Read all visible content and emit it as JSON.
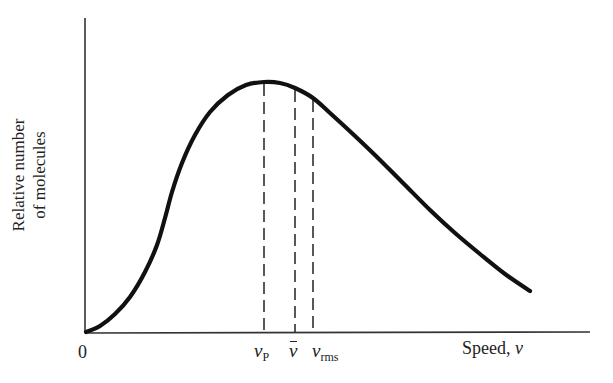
{
  "chart_data": {
    "type": "line",
    "title": "",
    "xlabel": "Speed, v",
    "ylabel": "Relative number of molecules",
    "ylabel_lines": [
      "Relative number",
      "of molecules"
    ],
    "x_tick_labels": [
      "0"
    ],
    "annotations": [
      {
        "label": "v_P",
        "text_main": "v",
        "text_sub": "P",
        "meaning": "most probable speed",
        "x_px": 264
      },
      {
        "label": "v̄",
        "text_main": "v",
        "meaning": "mean speed",
        "x_px": 295
      },
      {
        "label": "v_rms",
        "text_main": "v",
        "text_sub": "rms",
        "meaning": "root-mean-square speed",
        "x_px": 313
      }
    ],
    "grid": false,
    "legend": null,
    "series": [
      {
        "name": "Maxwell speed distribution",
        "description": "Curve rising from origin to a peak at v_P, then decaying with a long tail",
        "points_px": [
          [
            86,
            332
          ],
          [
            100,
            326
          ],
          [
            115,
            314
          ],
          [
            130,
            297
          ],
          [
            145,
            272
          ],
          [
            157,
            245
          ],
          [
            165,
            218
          ],
          [
            172,
            192
          ],
          [
            182,
            163
          ],
          [
            195,
            135
          ],
          [
            210,
            112
          ],
          [
            228,
            95
          ],
          [
            246,
            85
          ],
          [
            264,
            82
          ],
          [
            280,
            83
          ],
          [
            295,
            88
          ],
          [
            313,
            98
          ],
          [
            330,
            113
          ],
          [
            355,
            136
          ],
          [
            380,
            160
          ],
          [
            405,
            185
          ],
          [
            430,
            210
          ],
          [
            455,
            233
          ],
          [
            480,
            254
          ],
          [
            505,
            274
          ],
          [
            530,
            291
          ]
        ]
      }
    ],
    "axis": {
      "origin_px": [
        85,
        333
      ],
      "y_top_px": 18,
      "x_right_px": 590
    },
    "colors": {
      "curve": "#111111",
      "axes": "#333333",
      "dashed": "#222222"
    }
  },
  "labels": {
    "origin": "0",
    "x_axis_word": "Speed, ",
    "x_axis_var": "v",
    "y_line1": "Relative number",
    "y_line2": "of molecules",
    "vp_main": "v",
    "vp_sub": "P",
    "vbar_main": "v",
    "vrms_main": "v",
    "vrms_sub": "rms"
  }
}
